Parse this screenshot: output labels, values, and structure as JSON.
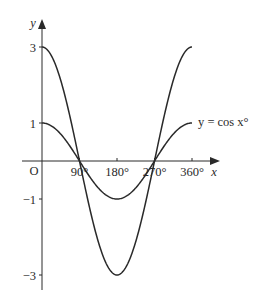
{
  "chart_data": {
    "type": "line",
    "title": "",
    "xlabel": "x",
    "ylabel": "y",
    "xlim": [
      0,
      360
    ],
    "ylim": [
      -3,
      3
    ],
    "grid": false,
    "origin_label": "O",
    "x_ticks": [
      {
        "value": 90,
        "label": "90°"
      },
      {
        "value": 180,
        "label": "180°"
      },
      {
        "value": 270,
        "label": "270°"
      },
      {
        "value": 360,
        "label": "360°"
      }
    ],
    "y_ticks": [
      {
        "value": 3,
        "label": "3"
      },
      {
        "value": 1,
        "label": "1"
      },
      {
        "value": -1,
        "label": "−1"
      },
      {
        "value": -3,
        "label": "−3"
      }
    ],
    "series": [
      {
        "name": "y = cos x°",
        "x": [
          0,
          90,
          180,
          270,
          360
        ],
        "values": [
          1,
          0,
          -1,
          0,
          1
        ],
        "amplitude": 1
      },
      {
        "name": "",
        "x": [
          0,
          90,
          180,
          270,
          360
        ],
        "values": [
          3,
          0,
          -3,
          0,
          3
        ],
        "amplitude": 3
      }
    ],
    "annotations": [
      {
        "text": "y = cos x°",
        "attached_to_series": 0,
        "position": "right end of curve"
      }
    ],
    "stroke_color": "#2a2a2a"
  }
}
